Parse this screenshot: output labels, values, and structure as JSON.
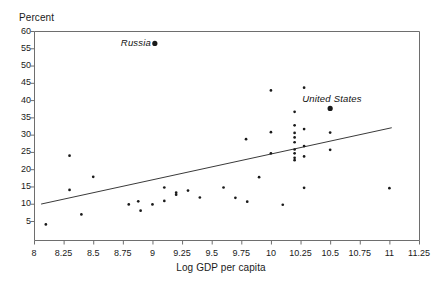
{
  "chart_data": {
    "type": "scatter",
    "title": "",
    "xlabel": "Log GDP per capita",
    "ylabel": "Percent",
    "xlim": [
      8,
      11.25
    ],
    "ylim": [
      0,
      60
    ],
    "xticks": [
      "8",
      "8.25",
      "8.5",
      "8.75",
      "9",
      "9.25",
      "9.5",
      "9.75",
      "10",
      "10.25",
      "10.5",
      "10.75",
      "11",
      "11.25"
    ],
    "xtick_values": [
      8,
      8.25,
      8.5,
      8.75,
      9,
      9.25,
      9.5,
      9.75,
      10,
      10.25,
      10.5,
      10.75,
      11,
      11.25
    ],
    "yticks": [
      "5",
      "10",
      "15",
      "20",
      "25",
      "30",
      "35",
      "40",
      "45",
      "50",
      "55",
      "60"
    ],
    "ytick_values": [
      5,
      10,
      15,
      20,
      25,
      30,
      35,
      40,
      45,
      50,
      55,
      60
    ],
    "grid": false,
    "legend": false,
    "marker_color": "#1a1a1a",
    "line_color": "#3a3a3a",
    "axis_color": "#6e6e6e",
    "points": [
      {
        "x": 8.1,
        "y": 4.0
      },
      {
        "x": 8.3,
        "y": 23.9
      },
      {
        "x": 8.3,
        "y": 14.0
      },
      {
        "x": 8.4,
        "y": 6.9
      },
      {
        "x": 8.5,
        "y": 17.8
      },
      {
        "x": 8.8,
        "y": 9.8
      },
      {
        "x": 8.88,
        "y": 10.7
      },
      {
        "x": 8.9,
        "y": 8.0
      },
      {
        "x": 9.0,
        "y": 9.8
      },
      {
        "x": 9.1,
        "y": 14.7
      },
      {
        "x": 9.1,
        "y": 10.8
      },
      {
        "x": 9.2,
        "y": 13.2
      },
      {
        "x": 9.2,
        "y": 12.6
      },
      {
        "x": 9.3,
        "y": 13.8
      },
      {
        "x": 9.4,
        "y": 11.8
      },
      {
        "x": 9.6,
        "y": 14.7
      },
      {
        "x": 9.7,
        "y": 11.7
      },
      {
        "x": 9.79,
        "y": 28.7
      },
      {
        "x": 9.8,
        "y": 10.6
      },
      {
        "x": 9.9,
        "y": 17.7
      },
      {
        "x": 10.0,
        "y": 42.8
      },
      {
        "x": 10.0,
        "y": 30.7
      },
      {
        "x": 10.0,
        "y": 24.6
      },
      {
        "x": 10.1,
        "y": 9.7
      },
      {
        "x": 10.2,
        "y": 36.6
      },
      {
        "x": 10.2,
        "y": 32.7
      },
      {
        "x": 10.2,
        "y": 30.5
      },
      {
        "x": 10.2,
        "y": 29.2
      },
      {
        "x": 10.2,
        "y": 27.8
      },
      {
        "x": 10.2,
        "y": 25.7
      },
      {
        "x": 10.2,
        "y": 24.6
      },
      {
        "x": 10.2,
        "y": 23.3
      },
      {
        "x": 10.2,
        "y": 22.6
      },
      {
        "x": 10.28,
        "y": 43.6
      },
      {
        "x": 10.28,
        "y": 31.6
      },
      {
        "x": 10.28,
        "y": 26.7
      },
      {
        "x": 10.28,
        "y": 23.7
      },
      {
        "x": 10.28,
        "y": 14.6
      },
      {
        "x": 10.5,
        "y": 30.6
      },
      {
        "x": 10.5,
        "y": 25.6
      },
      {
        "x": 11.0,
        "y": 14.5
      }
    ],
    "highlighted_points": [
      {
        "label": "Russia",
        "x": 9.02,
        "y": 56.4,
        "label_position": "left"
      },
      {
        "label": "United States",
        "x": 10.5,
        "y": 37.6,
        "label_position": "above"
      }
    ],
    "trendline": {
      "x_start": 8.06,
      "y_start": 9.9,
      "x_end": 11.02,
      "y_end": 32.0
    }
  }
}
